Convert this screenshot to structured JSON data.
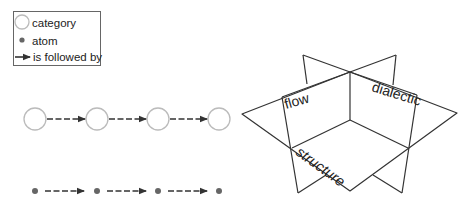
{
  "legend": {
    "items": [
      {
        "symbol": "open-circle",
        "label": "category"
      },
      {
        "symbol": "filled-dot",
        "label": "atom"
      },
      {
        "symbol": "arrow",
        "label": "is followed by"
      }
    ]
  },
  "sequences": {
    "categories": {
      "count": 4,
      "connector": "dashed-arrow"
    },
    "atoms": {
      "count": 4,
      "connector": "dashed-arrow"
    }
  },
  "planes_diagram": {
    "labels": {
      "flow": "flow",
      "dialectic": "dialectic",
      "structure": "structure"
    }
  },
  "colors": {
    "line": "#333333",
    "circle_stroke": "#bbbbbb",
    "dot_fill": "#666666",
    "text": "#222222"
  }
}
